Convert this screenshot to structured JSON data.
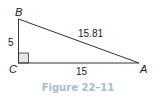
{
  "diagram": {
    "type": "right-triangle",
    "vertices": {
      "B": {
        "label": "B",
        "x": 18,
        "y": 19
      },
      "C": {
        "label": "C",
        "x": 18,
        "y": 63
      },
      "A": {
        "label": "A",
        "x": 139,
        "y": 63
      }
    },
    "right_angle_at": "C",
    "sides": {
      "BC": {
        "label": "5"
      },
      "CA": {
        "label": "15"
      },
      "AB": {
        "label": "15.81"
      }
    },
    "colors": {
      "stroke": "#333333",
      "right_angle_fill": "#e6e6e6",
      "caption": "#a9bccb"
    }
  },
  "caption": "Figure 22–11"
}
